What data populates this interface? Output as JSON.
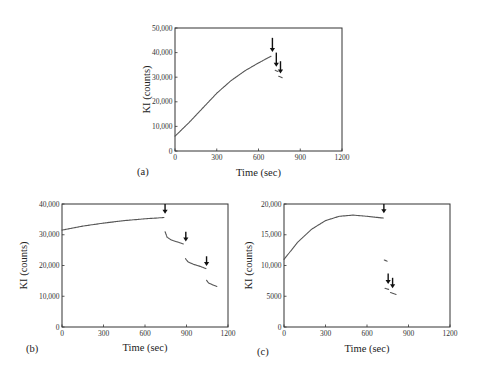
{
  "chart_data": [
    {
      "type": "scatter",
      "panel_label": "(a)",
      "xlabel": "Time (sec)",
      "ylabel": "KI (counts)",
      "xlim": [
        0,
        1200
      ],
      "ylim": [
        0,
        50000
      ],
      "xticks": [
        0,
        300,
        600,
        900,
        1200
      ],
      "xtick_labels": [
        "0",
        "300",
        "600",
        "900",
        "1200"
      ],
      "yticks": [
        0,
        10000,
        20000,
        30000,
        40000,
        50000
      ],
      "ytick_labels": [
        "0",
        "10,000",
        "20,000",
        "30,000",
        "40,000",
        "50,000"
      ],
      "grid": false,
      "series": [
        {
          "name": "segment-1",
          "x": [
            0,
            100,
            200,
            300,
            400,
            500,
            600,
            690
          ],
          "y": [
            6000,
            11500,
            17500,
            23500,
            28500,
            32500,
            35800,
            38500
          ]
        },
        {
          "name": "segment-2",
          "x": [
            720,
            740
          ],
          "y": [
            32800,
            32300
          ]
        },
        {
          "name": "segment-3",
          "x": [
            745,
            770
          ],
          "y": [
            30400,
            29800
          ]
        }
      ],
      "annotations": [
        {
          "type": "arrow",
          "x": 700,
          "y_top": 46000,
          "y_tip": 40200
        },
        {
          "type": "arrow",
          "x": 728,
          "y_top": 40000,
          "y_tip": 34200
        },
        {
          "type": "arrow",
          "x": 758,
          "y_top": 36500,
          "y_tip": 31500
        }
      ]
    },
    {
      "type": "scatter",
      "panel_label": "(b)",
      "xlabel": "Time (sec)",
      "ylabel": "KI (counts)",
      "xlim": [
        0,
        1200
      ],
      "ylim": [
        0,
        40000
      ],
      "xticks": [
        0,
        300,
        600,
        900,
        1200
      ],
      "xtick_labels": [
        "0",
        "300",
        "600",
        "900",
        "1200"
      ],
      "yticks": [
        0,
        10000,
        20000,
        30000,
        40000
      ],
      "ytick_labels": [
        "0",
        "10,000",
        "20,000",
        "30,000",
        "40,000"
      ],
      "grid": false,
      "series": [
        {
          "name": "segment-1",
          "x": [
            0,
            150,
            300,
            450,
            600,
            740
          ],
          "y": [
            31500,
            32800,
            33800,
            34600,
            35200,
            35600
          ]
        },
        {
          "name": "segment-2",
          "x": [
            745,
            760,
            790,
            830,
            880
          ],
          "y": [
            31000,
            29200,
            28300,
            27700,
            27000
          ]
        },
        {
          "name": "segment-3",
          "x": [
            893,
            910,
            950,
            1000,
            1040
          ],
          "y": [
            22200,
            21200,
            20400,
            19700,
            19000
          ]
        },
        {
          "name": "segment-4",
          "x": [
            1045,
            1060,
            1090,
            1120
          ],
          "y": [
            15200,
            14300,
            13700,
            13200
          ]
        }
      ],
      "annotations": [
        {
          "type": "arrow",
          "x": 745,
          "y_top": 40000,
          "y_tip": 36800
        },
        {
          "type": "arrow",
          "x": 895,
          "y_top": 31000,
          "y_tip": 27800
        },
        {
          "type": "arrow",
          "x": 1045,
          "y_top": 23000,
          "y_tip": 19800
        }
      ]
    },
    {
      "type": "scatter",
      "panel_label": "(c)",
      "xlabel": "Time (sec)",
      "ylabel": "KI (counts)",
      "xlim": [
        0,
        1200
      ],
      "ylim": [
        0,
        20000
      ],
      "xticks": [
        0,
        300,
        600,
        900,
        1200
      ],
      "xtick_labels": [
        "0",
        "300",
        "600",
        "900",
        "1200"
      ],
      "yticks": [
        0,
        5000,
        10000,
        15000,
        20000
      ],
      "ytick_labels": [
        "0",
        "5000",
        "10,000",
        "15,000",
        "20,000"
      ],
      "grid": false,
      "series": [
        {
          "name": "segment-1",
          "x": [
            0,
            100,
            200,
            300,
            400,
            500,
            600,
            720
          ],
          "y": [
            11000,
            13800,
            15900,
            17300,
            18000,
            18200,
            18000,
            17700
          ]
        },
        {
          "name": "segment-2",
          "x": [
            725,
            745
          ],
          "y": [
            10900,
            10700
          ]
        },
        {
          "name": "segment-3",
          "x": [
            730,
            760
          ],
          "y": [
            6300,
            6100
          ]
        },
        {
          "name": "segment-4",
          "x": [
            770,
            810
          ],
          "y": [
            5600,
            5300
          ]
        }
      ],
      "annotations": [
        {
          "type": "arrow",
          "x": 722,
          "y_top": 20000,
          "y_tip": 18500
        },
        {
          "type": "arrow",
          "x": 753,
          "y_top": 8700,
          "y_tip": 7000
        },
        {
          "type": "arrow",
          "x": 785,
          "y_top": 8000,
          "y_tip": 6300
        }
      ]
    }
  ],
  "panels": [
    {
      "id": "a",
      "label": "(a)",
      "x_title": "Time (sec)",
      "y_title": "KI (counts)"
    },
    {
      "id": "b",
      "label": "(b)",
      "x_title": "Time (sec)",
      "y_title": "KI (counts)"
    },
    {
      "id": "c",
      "label": "(c)",
      "x_title": "Time (sec)",
      "y_title": "KI (counts)"
    }
  ],
  "style": {
    "line_color": "#555555",
    "axis_color": "#333333",
    "arrow_color": "#111111"
  }
}
